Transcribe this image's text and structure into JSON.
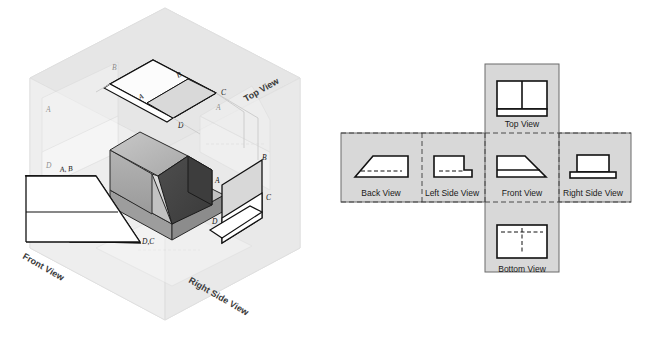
{
  "figure": {
    "type": "orthographic-projection-diagram",
    "background": "#ffffff"
  },
  "left_panel": {
    "name": "glass-box-isometric",
    "description": "Isometric glass box with object and three unfolded projection planes",
    "view_labels": {
      "top": "Top View",
      "front": "Front View",
      "right_side": "Right Side View"
    },
    "point_labels": {
      "top_plane": [
        "A",
        "B",
        "C",
        "D"
      ],
      "front_plane": [
        "A, B",
        "D,C"
      ],
      "right_plane": [
        "A",
        "B",
        "C",
        "D"
      ]
    },
    "colors": {
      "box_tint": "#e8e8e8",
      "plane_fill": "#ffffff",
      "object_top": "#b9b9b9",
      "object_left": "#a6a6a6",
      "object_front_slope": "#d2d2d2",
      "object_dark": "#4a4a4a",
      "outline": "#1a1a1a"
    }
  },
  "right_panel": {
    "name": "unfolded-six-view-layout",
    "colors": {
      "plane_fill": "#d8d8d8",
      "outline": "#6b6b6b",
      "fold_line": "#3a3a3a",
      "shape_stroke": "#111111",
      "shape_fill": "#ffffff"
    },
    "views": [
      {
        "id": "top-view",
        "label": "Top View",
        "shape": "rectangle-with-vertical-divider-and-lower-band",
        "hidden_lines": false
      },
      {
        "id": "back-view",
        "label": "Back View",
        "shape": "mirrored-trapezoid-with-hidden-line",
        "hidden_lines": true
      },
      {
        "id": "left-side-view",
        "label": "Left Side View",
        "shape": "stepped-L-with-hidden-line",
        "hidden_lines": true
      },
      {
        "id": "front-view",
        "label": "Front View",
        "shape": "trapezoid-with-base-band",
        "hidden_lines": false
      },
      {
        "id": "right-side-view",
        "label": "Right Side View",
        "shape": "T-shape-block-on-base",
        "hidden_lines": false
      },
      {
        "id": "bottom-view",
        "label": "Bottom View",
        "shape": "rectangle-with-hidden-cross-lines",
        "hidden_lines": true
      }
    ]
  }
}
